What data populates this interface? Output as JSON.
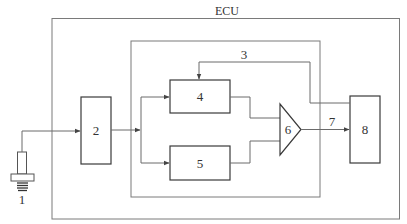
{
  "diagram": {
    "title": "ECU",
    "labels": {
      "sensor": "1",
      "block2": "2",
      "feedback": "3",
      "block4": "4",
      "block5": "5",
      "comparator": "6",
      "signal": "7",
      "block8": "8"
    },
    "colors": {
      "box_stroke": "#3a3a3a",
      "frame_stroke": "#7a7a7a",
      "wire": "#6a6a6a",
      "background": "#ffffff"
    }
  }
}
